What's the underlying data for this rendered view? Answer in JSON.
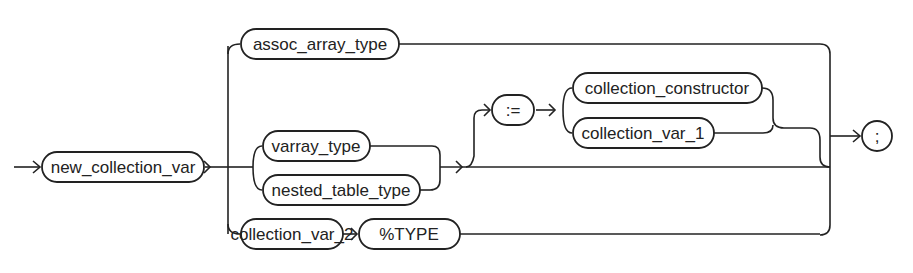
{
  "diagram": {
    "type": "syntax-railroad-diagram",
    "nodes": {
      "new_collection_var": "new_collection_var",
      "assoc_array_type": "assoc_array_type",
      "varray_type": "varray_type",
      "nested_table_type": "nested_table_type",
      "assign_op": ":=",
      "collection_constructor": "collection_constructor",
      "collection_var_1": "collection_var_1",
      "collection_var_2": "collection_var_2",
      "type_attr": "%TYPE",
      "semicolon": ";"
    },
    "colors": {
      "stroke": "#222222",
      "background": "#ffffff"
    }
  }
}
